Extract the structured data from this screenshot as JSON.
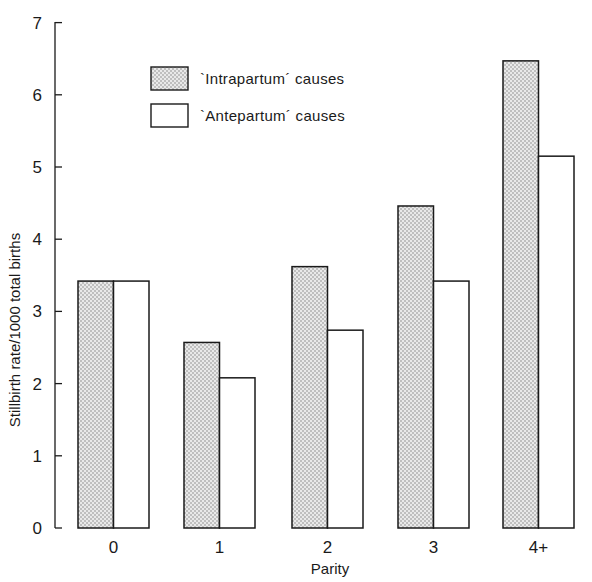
{
  "chart_data": {
    "type": "bar",
    "title": "",
    "xlabel": "Parity",
    "ylabel": "Stillbirth rate/1000 total births",
    "categories": [
      "0",
      "1",
      "2",
      "3",
      "4+"
    ],
    "series": [
      {
        "name": "`Intrapartum' causes",
        "pattern": "stippled",
        "values": [
          3.42,
          2.57,
          3.62,
          4.46,
          6.47
        ]
      },
      {
        "name": "`Antepartum' causes",
        "pattern": "open",
        "values": [
          3.42,
          2.08,
          2.74,
          3.42,
          5.15
        ]
      }
    ],
    "ylim": [
      0,
      7
    ],
    "yticks": [
      0,
      1,
      2,
      3,
      4,
      5,
      6,
      7
    ],
    "grid": false,
    "legend_position": "upper-left-inside"
  },
  "legend": {
    "intrapartum_label": "`Intrapartum´ causes",
    "antepartum_label": "`Antepartum´ causes"
  },
  "axes": {
    "xlabel": "Parity",
    "ylabel": "Stillbirth rate/1000 total births"
  },
  "colors": {
    "ink": "#1a1a1a",
    "stipple_bg": "#e6e6e6",
    "stipple_dot": "#7a7a7a",
    "open_fill": "#ffffff"
  }
}
